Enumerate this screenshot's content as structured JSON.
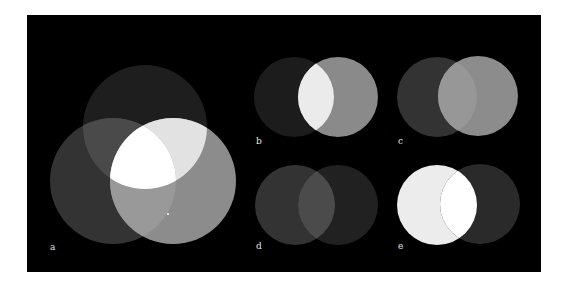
{
  "figure": {
    "background": "#ffffff",
    "panel_bg": "#000000",
    "frame": {
      "x": 27,
      "y": 15,
      "w": 514,
      "h": 257
    }
  },
  "panels": [
    {
      "id": "a",
      "label": "a",
      "label_pos": {
        "x": 50,
        "y": 250
      },
      "circles": [
        {
          "name": "top",
          "cx": 145,
          "cy": 127,
          "r": 62,
          "color": "#1e1e1e"
        },
        {
          "name": "bottom-left",
          "cx": 113,
          "cy": 181,
          "r": 63,
          "color": "#333333"
        },
        {
          "name": "bottom-right",
          "cx": 173,
          "cy": 181,
          "r": 63,
          "color": "#8c8c8c"
        }
      ],
      "overlaps": [
        {
          "sets": [
            "top",
            "bottom-left"
          ],
          "color": "#4a4a4a"
        },
        {
          "sets": [
            "top",
            "bottom-right"
          ],
          "color": "#e2e2e2"
        },
        {
          "sets": [
            "bottom-left",
            "bottom-right"
          ],
          "color": "#999999"
        },
        {
          "sets": [
            "top",
            "bottom-left",
            "bottom-right"
          ],
          "color": "#ffffff"
        }
      ],
      "marks": [
        {
          "x": 168,
          "y": 214,
          "r": 1,
          "color": "#ffffff"
        }
      ]
    },
    {
      "id": "b",
      "label": "b",
      "label_pos": {
        "x": 256,
        "y": 144
      },
      "circles": [
        {
          "name": "left",
          "cx": 294,
          "cy": 97,
          "r": 40,
          "color": "#1c1c1c"
        },
        {
          "name": "right",
          "cx": 338,
          "cy": 97,
          "r": 40,
          "color": "#8a8a8a"
        }
      ],
      "overlaps": [
        {
          "sets": [
            "left",
            "right"
          ],
          "color": "#ebebeb"
        }
      ]
    },
    {
      "id": "c",
      "label": "c",
      "label_pos": {
        "x": 398,
        "y": 144
      },
      "circles": [
        {
          "name": "left",
          "cx": 437,
          "cy": 97,
          "r": 40,
          "color": "#333333"
        },
        {
          "name": "right",
          "cx": 478,
          "cy": 96,
          "r": 40,
          "color": "#8c8c8c"
        }
      ],
      "overlaps": [
        {
          "sets": [
            "left",
            "right"
          ],
          "color": "#979797"
        }
      ]
    },
    {
      "id": "d",
      "label": "d",
      "label_pos": {
        "x": 256,
        "y": 249
      },
      "circles": [
        {
          "name": "left",
          "cx": 295,
          "cy": 205,
          "r": 40,
          "color": "#333333"
        },
        {
          "name": "right",
          "cx": 338,
          "cy": 205,
          "r": 40,
          "color": "#212121"
        }
      ],
      "overlaps": [
        {
          "sets": [
            "left",
            "right"
          ],
          "color": "#4b4b4b"
        }
      ]
    },
    {
      "id": "e",
      "label": "e",
      "label_pos": {
        "x": 398,
        "y": 249
      },
      "circles": [
        {
          "name": "left",
          "cx": 437,
          "cy": 205,
          "r": 40,
          "color": "#ececec"
        },
        {
          "name": "right",
          "cx": 480,
          "cy": 204,
          "r": 40,
          "color": "#2a2a2a"
        }
      ],
      "overlaps": [
        {
          "sets": [
            "left",
            "right"
          ],
          "color": "#ffffff"
        }
      ]
    }
  ]
}
